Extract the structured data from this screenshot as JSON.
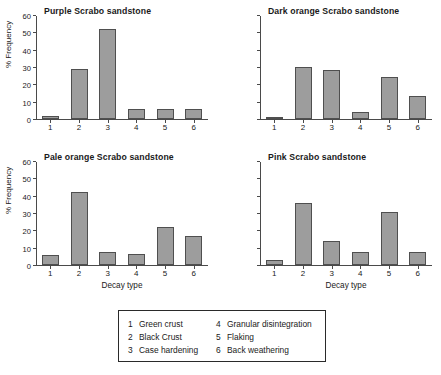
{
  "chart_data": [
    {
      "type": "bar",
      "title": "Purple Scrabo sandstone",
      "categories": [
        "1",
        "2",
        "3",
        "4",
        "5",
        "6"
      ],
      "values": [
        2,
        29,
        52,
        5.5,
        5.5,
        5.5
      ],
      "xlabel": "",
      "ylabel": "% Frequency",
      "ylim": [
        0,
        60
      ],
      "yticks": [
        0,
        10,
        20,
        30,
        40,
        50,
        60
      ],
      "ytick_labels_shown": true,
      "xlabel_shown": false,
      "grid": false,
      "legend_position": "below-figure"
    },
    {
      "type": "bar",
      "title": "Dark orange Scrabo sandstone",
      "categories": [
        "1",
        "2",
        "3",
        "4",
        "5",
        "6"
      ],
      "values": [
        1,
        30,
        28.5,
        4,
        24,
        13
      ],
      "xlabel": "",
      "ylabel": "% Frequency",
      "ylim": [
        0,
        60
      ],
      "yticks": [
        0,
        10,
        20,
        30,
        40,
        50,
        60
      ],
      "ytick_labels_shown": false,
      "xlabel_shown": false,
      "grid": false,
      "legend_position": "below-figure"
    },
    {
      "type": "bar",
      "title": "Pale orange Scrabo sandstone",
      "categories": [
        "1",
        "2",
        "3",
        "4",
        "5",
        "6"
      ],
      "values": [
        6,
        42,
        7.5,
        6.5,
        22,
        16.5
      ],
      "xlabel": "Decay type",
      "ylabel": "% Frequency",
      "ylim": [
        0,
        60
      ],
      "yticks": [
        0,
        10,
        20,
        30,
        40,
        50,
        60
      ],
      "ytick_labels_shown": true,
      "xlabel_shown": true,
      "grid": false,
      "legend_position": "below-figure"
    },
    {
      "type": "bar",
      "title": "Pink Scrabo sandstone",
      "categories": [
        "1",
        "2",
        "3",
        "4",
        "5",
        "6"
      ],
      "values": [
        3,
        36,
        14,
        7.5,
        30.5,
        7.5
      ],
      "xlabel": "Decay type",
      "ylabel": "% Frequency",
      "ylim": [
        0,
        60
      ],
      "yticks": [
        0,
        10,
        20,
        30,
        40,
        50,
        60
      ],
      "ytick_labels_shown": false,
      "xlabel_shown": true,
      "grid": false,
      "legend_position": "below-figure"
    }
  ],
  "legend": {
    "entries": [
      {
        "number": "1",
        "label": "Green crust"
      },
      {
        "number": "2",
        "label": "Black Crust"
      },
      {
        "number": "3",
        "label": "Case hardening"
      },
      {
        "number": "4",
        "label": "Granular disintegration"
      },
      {
        "number": "5",
        "label": "Flaking"
      },
      {
        "number": "6",
        "label": "Back weathering"
      }
    ]
  },
  "style": {
    "bar_fill": "#9d9d9d",
    "bar_stroke": "#4f4f4f",
    "axis_color": "#4a4a4a",
    "text_color": "#1a1a1a",
    "background": "#ffffff"
  }
}
